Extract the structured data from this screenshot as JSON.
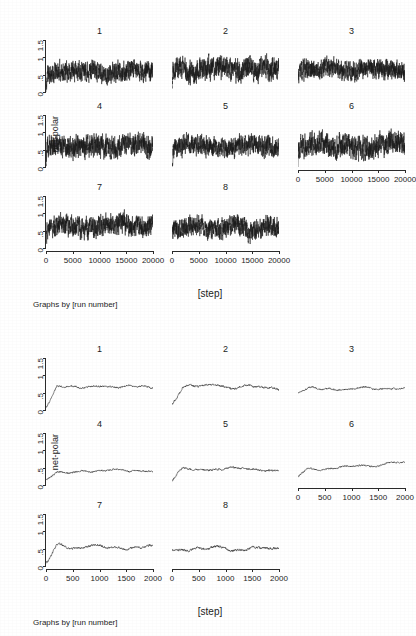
{
  "document": {
    "kind": "scanned-figure-page",
    "background_color": "#ffffff",
    "ink_color": "#1a1a1a"
  },
  "figures": [
    {
      "id": "figure-top",
      "ylabel": "net-polar",
      "xlabel": "[step]",
      "note": "Graphs by [run number]",
      "panel_titles": [
        "1",
        "2",
        "3",
        "4",
        "5",
        "6",
        "7",
        "8"
      ],
      "ytick_labels": [
        "0",
        ".5",
        "1",
        "1.5"
      ],
      "ytick_values": [
        0,
        0.5,
        1,
        1.5
      ],
      "xtick_labels": [
        "0",
        "5000",
        "10000",
        "15000",
        "20000"
      ],
      "xtick_values": [
        0,
        5000,
        10000,
        15000,
        20000
      ]
    },
    {
      "id": "figure-bottom",
      "ylabel": "net-polar",
      "xlabel": "[step]",
      "note": "Graphs by [run number]",
      "panel_titles": [
        "1",
        "2",
        "3",
        "4",
        "5",
        "6",
        "7",
        "8"
      ],
      "ytick_labels": [
        "0",
        ".5",
        "1",
        "1.5"
      ],
      "ytick_values": [
        0,
        0.5,
        1,
        1.5
      ],
      "xtick_labels": [
        "0",
        "500",
        "1000",
        "1500",
        "2000"
      ],
      "xtick_values": [
        0,
        500,
        1000,
        1500,
        2000
      ]
    }
  ],
  "chart_data": [
    {
      "type": "line",
      "id": "figure-top",
      "title": "",
      "xlabel": "[step]",
      "ylabel": "net-polar",
      "note": "Graphs by [run number]",
      "grid": false,
      "legend": "none",
      "xlim": [
        0,
        20000
      ],
      "ylim": [
        0,
        1.5
      ],
      "facet_by": "[run number]",
      "facet_layout": [
        3,
        3
      ],
      "series": [
        {
          "name": "1",
          "mean": 0.62,
          "amplitude": 0.22,
          "start": 0.05,
          "trend": -0.05,
          "seed": 11
        },
        {
          "name": "2",
          "mean": 0.66,
          "amplitude": 0.26,
          "start": 0.3,
          "trend": 0.0,
          "seed": 22
        },
        {
          "name": "3",
          "mean": 0.63,
          "amplitude": 0.22,
          "start": 0.48,
          "trend": 0.02,
          "seed": 33
        },
        {
          "name": "4",
          "mean": 0.58,
          "amplitude": 0.25,
          "start": 0.18,
          "trend": 0.05,
          "seed": 44
        },
        {
          "name": "5",
          "mean": 0.6,
          "amplitude": 0.22,
          "start": 0.1,
          "trend": 0.0,
          "seed": 55
        },
        {
          "name": "6",
          "mean": 0.6,
          "amplitude": 0.26,
          "start": 0.22,
          "trend": 0.04,
          "seed": 66
        },
        {
          "name": "7",
          "mean": 0.61,
          "amplitude": 0.24,
          "start": 0.3,
          "trend": 0.05,
          "seed": 77
        },
        {
          "name": "8",
          "mean": 0.6,
          "amplitude": 0.23,
          "start": 0.45,
          "trend": -0.02,
          "seed": 88
        }
      ]
    },
    {
      "type": "line",
      "id": "figure-bottom",
      "title": "",
      "xlabel": "[step]",
      "ylabel": "net-polar",
      "note": "Graphs by [run number]",
      "grid": false,
      "legend": "none",
      "xlim": [
        0,
        2000
      ],
      "ylim": [
        0,
        1.5
      ],
      "facet_by": "[run number]",
      "facet_layout": [
        3,
        3
      ],
      "series": [
        {
          "name": "1",
          "mean": 0.66,
          "amplitude": 0.07,
          "start": 0.1,
          "trend": 0.02,
          "seed": 111
        },
        {
          "name": "2",
          "mean": 0.72,
          "amplitude": 0.09,
          "start": 0.12,
          "trend": -0.08,
          "seed": 122
        },
        {
          "name": "3",
          "mean": 0.6,
          "amplitude": 0.07,
          "start": 0.52,
          "trend": 0.03,
          "seed": 133
        },
        {
          "name": "4",
          "mean": 0.4,
          "amplitude": 0.07,
          "start": 0.12,
          "trend": 0.0,
          "seed": 144
        },
        {
          "name": "5",
          "mean": 0.47,
          "amplitude": 0.08,
          "start": 0.08,
          "trend": -0.02,
          "seed": 155
        },
        {
          "name": "6",
          "mean": 0.42,
          "amplitude": 0.07,
          "start": 0.22,
          "trend": 0.22,
          "seed": 166
        },
        {
          "name": "7",
          "mean": 0.58,
          "amplitude": 0.09,
          "start": 0.06,
          "trend": -0.06,
          "seed": 177
        },
        {
          "name": "8",
          "mean": 0.51,
          "amplitude": 0.1,
          "start": 0.42,
          "trend": -0.02,
          "seed": 188
        }
      ]
    }
  ]
}
